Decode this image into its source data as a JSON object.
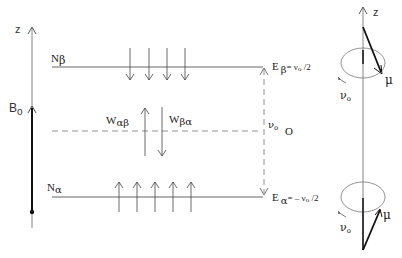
{
  "diagram": {
    "left_axis": {
      "axis_label": "z",
      "field_label_main": "B",
      "field_label_sub": "o"
    },
    "upper_level": {
      "population_main": "N",
      "population_sub": "β",
      "energy_main": "E",
      "energy_sub": "β",
      "energy_value": "= ν",
      "energy_value_sub": "o",
      "energy_value_tail": " /2",
      "spin_arrows": 4,
      "spin_direction": "down"
    },
    "lower_level": {
      "population_main": "N",
      "population_sub": "α",
      "energy_main": "E",
      "energy_sub": "α",
      "energy_value": "= – ν",
      "energy_value_sub": "o",
      "energy_value_tail": " /2",
      "spin_arrows": 5,
      "spin_direction": "up"
    },
    "transitions": {
      "up_label_main": "W",
      "up_label_sub": "αβ",
      "down_label_main": "W",
      "down_label_sub": "βα"
    },
    "gap": {
      "label_main": "ν",
      "label_sub": "o",
      "zero_label": "O"
    },
    "precession": {
      "axis_label": "z",
      "top": {
        "moment_label": "μ",
        "freq_main": "ν",
        "freq_sub": "o"
      },
      "bottom": {
        "moment_label": "μ",
        "freq_main": "ν",
        "freq_sub": "o"
      }
    }
  }
}
